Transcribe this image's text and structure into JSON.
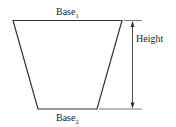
{
  "diagram": {
    "type": "trapezoid",
    "labels": {
      "base1": "Base",
      "base1_sub": "1",
      "base2": "Base",
      "base2_sub": "2",
      "height": "Height"
    },
    "colors": {
      "stroke": "#333333",
      "text": "#222222",
      "background": "#ffffff"
    }
  }
}
